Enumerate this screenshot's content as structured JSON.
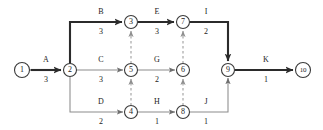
{
  "diagram": {
    "type": "aoa-network",
    "canvas": {
      "width": 323,
      "height": 130
    },
    "colors": {
      "background": "#ffffff",
      "node_stroke": "#3a3a3a",
      "edge_normal": "#8c8c8c",
      "edge_critical": "#2b2b2b",
      "edge_dummy": "#9a9a9a",
      "text": "#1c1c1c"
    },
    "nodes": [
      {
        "id": "1",
        "label": "1",
        "x": 22,
        "y": 70,
        "r": 7.5
      },
      {
        "id": "2",
        "label": "2",
        "x": 70,
        "y": 70,
        "r": 6.5
      },
      {
        "id": "3",
        "label": "3",
        "x": 131,
        "y": 22,
        "r": 6.5
      },
      {
        "id": "4",
        "label": "4",
        "x": 131,
        "y": 112,
        "r": 6.5
      },
      {
        "id": "5",
        "label": "5",
        "x": 131,
        "y": 70,
        "r": 6.5
      },
      {
        "id": "6",
        "label": "6",
        "x": 183,
        "y": 70,
        "r": 6.5
      },
      {
        "id": "7",
        "label": "7",
        "x": 183,
        "y": 22,
        "r": 6.5
      },
      {
        "id": "8",
        "label": "8",
        "x": 183,
        "y": 112,
        "r": 6.5
      },
      {
        "id": "9",
        "label": "9",
        "x": 228,
        "y": 70,
        "r": 6.5
      },
      {
        "id": "10",
        "label": "10",
        "x": 303,
        "y": 70,
        "r": 7.5
      }
    ],
    "activities": [
      {
        "id": "A",
        "name": "A",
        "duration": "3",
        "from": "1",
        "to": "2",
        "critical": false,
        "label_x": 46,
        "label_name_y": 62,
        "label_dur_y": 82
      },
      {
        "id": "B",
        "name": "B",
        "duration": "3",
        "from": "2",
        "to": "3",
        "critical": true,
        "label_x": 101,
        "label_name_y": 14,
        "label_dur_y": 34
      },
      {
        "id": "C",
        "name": "C",
        "duration": "3",
        "from": "2",
        "to": "5",
        "critical": false,
        "label_x": 101,
        "label_name_y": 62,
        "label_dur_y": 82
      },
      {
        "id": "D",
        "name": "D",
        "duration": "2",
        "from": "2",
        "to": "4",
        "critical": false,
        "label_x": 101,
        "label_name_y": 104,
        "label_dur_y": 124
      },
      {
        "id": "E",
        "name": "E",
        "duration": "3",
        "from": "3",
        "to": "7",
        "critical": true,
        "label_x": 157,
        "label_name_y": 14,
        "label_dur_y": 34
      },
      {
        "id": "G",
        "name": "G",
        "duration": "2",
        "from": "5",
        "to": "6",
        "critical": false,
        "label_x": 157,
        "label_name_y": 62,
        "label_dur_y": 82
      },
      {
        "id": "H",
        "name": "H",
        "duration": "1",
        "from": "4",
        "to": "8",
        "critical": false,
        "label_x": 157,
        "label_name_y": 104,
        "label_dur_y": 124
      },
      {
        "id": "I",
        "name": "I",
        "duration": "2",
        "from": "7",
        "to": "9",
        "critical": true,
        "label_x": 206,
        "label_name_y": 14,
        "label_dur_y": 34
      },
      {
        "id": "J",
        "name": "J",
        "duration": "1",
        "from": "8",
        "to": "9",
        "critical": false,
        "label_x": 206,
        "label_name_y": 104,
        "label_dur_y": 124
      },
      {
        "id": "K",
        "name": "K",
        "duration": "1",
        "from": "9",
        "to": "10",
        "critical": true,
        "label_x": 266,
        "label_name_y": 62,
        "label_dur_y": 82
      }
    ],
    "dummies": [
      {
        "id": "d-5-3",
        "from": "5",
        "to": "3"
      },
      {
        "id": "d-4-5",
        "from": "4",
        "to": "5"
      },
      {
        "id": "d-6-7",
        "from": "6",
        "to": "7"
      },
      {
        "id": "d-8-6",
        "from": "8",
        "to": "6"
      }
    ]
  }
}
